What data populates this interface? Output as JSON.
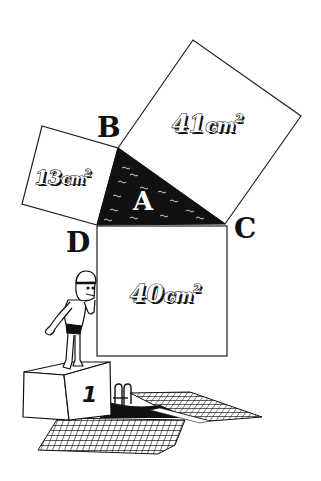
{
  "diagram": {
    "vertices": {
      "b": "B",
      "c": "C",
      "d": "D"
    },
    "triangle": {
      "label": "A",
      "fill": "#111111"
    },
    "squares": {
      "hypotenuse": {
        "value": "41",
        "unit": "cm",
        "exp": "2"
      },
      "left_leg": {
        "value": "13",
        "unit": "cm",
        "exp": "2"
      },
      "bottom_leg": {
        "value": "40",
        "unit": "cm",
        "exp": "2"
      }
    },
    "podium": {
      "number": "1"
    },
    "colors": {
      "ink": "#111111",
      "paper": "#ffffff"
    }
  }
}
